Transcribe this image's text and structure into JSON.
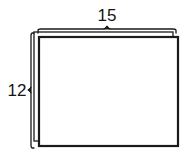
{
  "figure": {
    "name": "rectangle-with-dimension-braces",
    "background_color": "#ffffff",
    "stroke_color": "#1a1a1a",
    "fill_color": "#ffffff",
    "shape": {
      "type": "rectangle-prism-outline",
      "front_face": {
        "x": 39,
        "y": 37,
        "width": 139,
        "height": 109,
        "stroke_width": 2.2
      },
      "back_face": {
        "x": 34,
        "y": 32,
        "width": 139,
        "height": 109,
        "stroke_width": 1.4,
        "offset_x": -5,
        "offset_y": -5
      }
    },
    "dimensions": [
      {
        "id": "width-dimension",
        "label": "15",
        "orientation": "horizontal",
        "position": "top",
        "brace_start": 38,
        "brace_end": 176,
        "brace_y": 29,
        "apex_x": 107,
        "label_x": 107,
        "label_y": 20
      },
      {
        "id": "height-dimension",
        "label": "12",
        "orientation": "vertical",
        "position": "left",
        "brace_start": 33,
        "brace_end": 148,
        "brace_x": 31,
        "apex_y": 90,
        "label_x": 17,
        "label_y": 95
      }
    ]
  }
}
